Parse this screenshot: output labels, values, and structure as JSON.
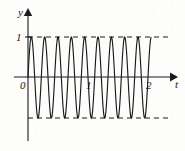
{
  "figure": {
    "kind": "line-plot",
    "background_color": "#fdfdfc",
    "ink_color": "#1a1a1a"
  },
  "axes": {
    "y_axis": {
      "label": "y",
      "x_px": 28,
      "top_px": 11,
      "bottom_px": 141,
      "arrow": "up"
    },
    "t_axis": {
      "label": "t",
      "y_px": 77,
      "left_px": 14,
      "right_px": 173,
      "arrow": "right"
    },
    "origin_label": "0"
  },
  "ticks": {
    "y": [
      {
        "label": "1",
        "value": 1,
        "y_px": 37
      }
    ],
    "t": [
      {
        "label": "1",
        "value": 1,
        "x_px": 89
      },
      {
        "label": "2",
        "value": 2,
        "x_px": 149
      }
    ]
  },
  "guides": {
    "upper_dashed": {
      "value": 1,
      "y_px": 37,
      "x_from": 28,
      "x_to": 170,
      "style": "dashed"
    },
    "lower_dashed": {
      "value": -1,
      "y_px": 118,
      "x_from": 28,
      "x_to": 170,
      "style": "dashed"
    }
  },
  "chart_data": {
    "type": "line",
    "title": "",
    "xlabel": "t",
    "ylabel": "y",
    "xlim": [
      0,
      2.3
    ],
    "ylim": [
      -1.15,
      1.15
    ],
    "grid": false,
    "legend": null,
    "annotations": [
      "dashed envelope at y = 1",
      "dashed envelope at y = -1"
    ],
    "xticks": [
      0,
      1,
      2
    ],
    "xticklabels": [
      "0",
      "1",
      "2"
    ],
    "yticks": [
      1
    ],
    "yticklabels": [
      "1"
    ],
    "series": [
      {
        "name": "y = sin(2*pi*f*t)",
        "amplitude": 1,
        "cycles_drawn": 9.2,
        "period_t": 0.222,
        "frequency_cycles_per_unit_t": 4.5,
        "phase": 0,
        "t_start": 0,
        "t_end": 2.05,
        "waveform": "sine",
        "color": "#1a1a1a",
        "linewidth": 1.1
      }
    ]
  }
}
